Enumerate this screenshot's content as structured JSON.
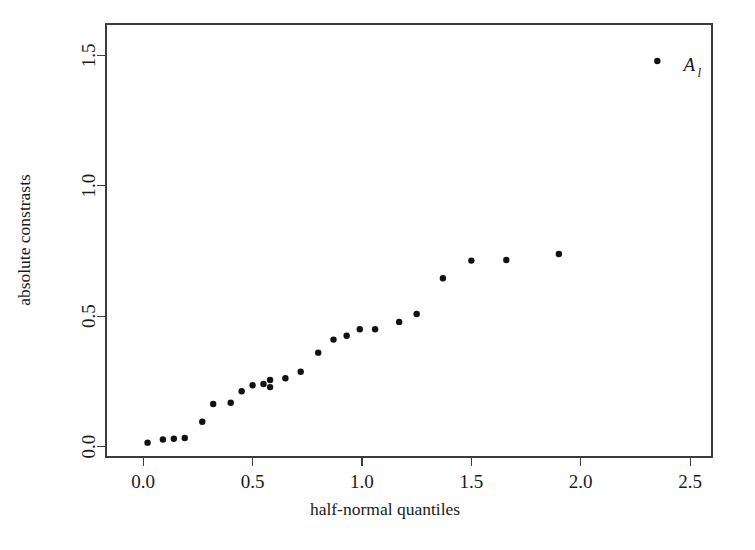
{
  "chart_data": {
    "type": "scatter",
    "title": "",
    "xlabel": "half-normal quantiles",
    "ylabel": "absolute constrasts",
    "xlim": [
      -0.17,
      2.6
    ],
    "ylim": [
      -0.04,
      1.62
    ],
    "xticks": [
      0.0,
      0.5,
      1.0,
      1.5,
      2.0,
      2.5
    ],
    "xticklabels": [
      "0.0",
      "0.5",
      "1.0",
      "1.5",
      "2.0",
      "2.5"
    ],
    "yticks": [
      0.0,
      0.5,
      1.0,
      1.5
    ],
    "yticklabels": [
      "0.0",
      "0.5",
      "1.0",
      "1.5"
    ],
    "grid": false,
    "legend": false,
    "marker": "filled-circle",
    "marker_color": "#111111",
    "frame_color": "#3c3c3c",
    "series": [
      {
        "name": "absolute contrasts",
        "x": [
          0.02,
          0.09,
          0.14,
          0.19,
          0.27,
          0.32,
          0.4,
          0.45,
          0.5,
          0.55,
          0.58,
          0.58,
          0.65,
          0.72,
          0.8,
          0.87,
          0.93,
          0.99,
          1.06,
          1.17,
          1.25,
          1.37,
          1.5,
          1.66,
          1.9,
          2.35
        ],
        "y": [
          0.015,
          0.027,
          0.03,
          0.033,
          0.095,
          0.163,
          0.168,
          0.212,
          0.235,
          0.24,
          0.255,
          0.228,
          0.262,
          0.287,
          0.36,
          0.41,
          0.425,
          0.45,
          0.45,
          0.478,
          0.508,
          0.645,
          0.713,
          0.715,
          0.738,
          1.478
        ]
      }
    ],
    "annotations": [
      {
        "name": "outlier-label",
        "text": "A",
        "subscript": "l",
        "x": 2.47,
        "y": 1.44,
        "refers_to_point_index": 25
      }
    ]
  },
  "axes": {
    "x_title": "half-normal quantiles",
    "y_title": "absolute constrasts"
  }
}
